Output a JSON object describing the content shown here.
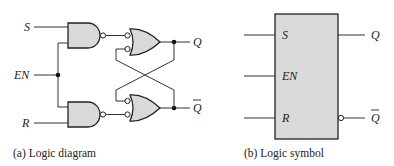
{
  "diagram_a": {
    "caption": "(a) Logic diagram",
    "inputs": {
      "s": "S",
      "en": "EN",
      "r": "R"
    },
    "outputs": {
      "q": "Q",
      "q_bar": "Q"
    },
    "gates": [
      {
        "id": "nand-upper",
        "type": "NAND",
        "inputs": [
          "S",
          "EN"
        ]
      },
      {
        "id": "nand-lower",
        "type": "NAND",
        "inputs": [
          "EN",
          "R"
        ]
      },
      {
        "id": "or-upper",
        "type": "OR (negated inputs)",
        "inputs": [
          "nand-upper",
          "Q-bar feedback"
        ],
        "output": "Q"
      },
      {
        "id": "or-lower",
        "type": "OR (negated inputs)",
        "inputs": [
          "Q feedback",
          "nand-lower"
        ],
        "output": "Q-bar"
      }
    ]
  },
  "diagram_b": {
    "caption": "(b) Logic symbol",
    "inputs": {
      "s": "S",
      "en": "EN",
      "r": "R"
    },
    "outputs": {
      "q": "Q",
      "q_bar": "Q"
    }
  },
  "colors": {
    "gate_fill": "#d9d9d9",
    "line": "#222222",
    "background": "#ffffff"
  }
}
